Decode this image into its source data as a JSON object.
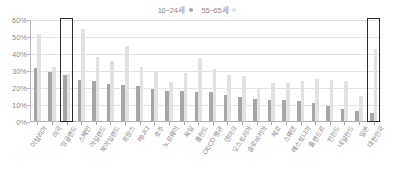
{
  "chart_data": {
    "type": "bar",
    "title": "",
    "xlabel": "",
    "ylabel": "",
    "ylim": [
      0,
      60
    ],
    "yticks": [
      "0%",
      "10%",
      "20%",
      "30%",
      "40%",
      "50%",
      "60%"
    ],
    "ytick_values": [
      0,
      10,
      20,
      30,
      40,
      50,
      60
    ],
    "grid": true,
    "legend_position": "top-center",
    "categories": [
      "이탈리아",
      "미국",
      "잉글랜드",
      "스페인",
      "아일랜드",
      "북아일랜드",
      "프랑스",
      "캐나다",
      "호주",
      "노르웨이",
      "독일",
      "폴란드",
      "OECD 평균",
      "덴마크",
      "오스트리아",
      "슬로바키아",
      "체코",
      "스웨덴",
      "에스토니아",
      "플랜드르",
      "핀란드",
      "네덜란드",
      "일본",
      "대한민국"
    ],
    "series": [
      {
        "name": "16~24세",
        "color": "#a6a6a6",
        "values": [
          31.5,
          29.5,
          27.8,
          24.8,
          24.0,
          22.5,
          21.8,
          21.0,
          19.5,
          18.3,
          18.0,
          17.8,
          17.5,
          16.0,
          14.8,
          13.5,
          13.2,
          13.0,
          12.2,
          11.2,
          9.5,
          7.8,
          6.5,
          5.2
        ]
      },
      {
        "name": "55~65세",
        "color": "#e2e2e2",
        "values": [
          51.8,
          32.5,
          28.0,
          55.0,
          38.5,
          36.0,
          45.0,
          32.5,
          30.0,
          23.5,
          29.0,
          37.5,
          31.0,
          27.5,
          27.0,
          20.0,
          23.0,
          23.0,
          24.0,
          25.5,
          25.0,
          24.0,
          15.5,
          43.0
        ]
      }
    ],
    "highlights": [
      {
        "category": "잉글랜드",
        "label": "highlight-england"
      },
      {
        "category": "대한민국",
        "label": "highlight-korea"
      }
    ]
  }
}
